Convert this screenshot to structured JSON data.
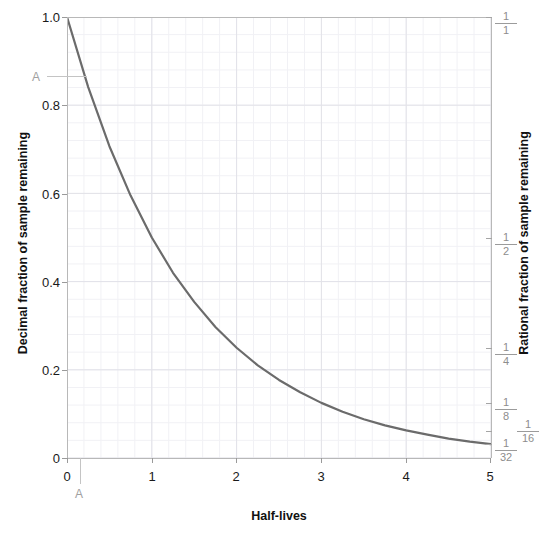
{
  "chart_data": {
    "type": "line",
    "title": "",
    "xlabel": "Half-lives",
    "ylabel": "Decimal fraction of sample remaining",
    "y2label": "Rational fraction of sample remaining",
    "xlim": [
      0,
      5
    ],
    "ylim": [
      0,
      1
    ],
    "grid": true,
    "minor_grid": true,
    "legend": "none",
    "series": [
      {
        "name": "remaining fraction",
        "color": "#6b6b6b",
        "x": [
          0,
          0.25,
          0.5,
          0.75,
          1,
          1.25,
          1.5,
          1.75,
          2,
          2.25,
          2.5,
          2.75,
          3,
          3.25,
          3.5,
          3.75,
          4,
          4.25,
          4.5,
          4.75,
          5
        ],
        "y": [
          1.0,
          0.841,
          0.707,
          0.595,
          0.5,
          0.42,
          0.354,
          0.297,
          0.25,
          0.21,
          0.177,
          0.149,
          0.125,
          0.105,
          0.088,
          0.074,
          0.0625,
          0.053,
          0.044,
          0.037,
          0.03125
        ]
      }
    ],
    "x_ticks": [
      {
        "value": 0,
        "label": "0"
      },
      {
        "value": 1,
        "label": "1"
      },
      {
        "value": 2,
        "label": "2"
      },
      {
        "value": 3,
        "label": "3"
      },
      {
        "value": 4,
        "label": "4"
      },
      {
        "value": 5,
        "label": "5"
      }
    ],
    "y_ticks": [
      {
        "value": 0,
        "label": "0"
      },
      {
        "value": 0.2,
        "label": "0.2"
      },
      {
        "value": 0.4,
        "label": "0.4"
      },
      {
        "value": 0.6,
        "label": "0.6"
      },
      {
        "value": 0.8,
        "label": "0.8"
      },
      {
        "value": 1.0,
        "label": "1.0"
      }
    ],
    "y2_ticks": [
      {
        "value": 1.0,
        "numerator": "1",
        "denominator": "1"
      },
      {
        "value": 0.5,
        "numerator": "1",
        "denominator": "2"
      },
      {
        "value": 0.25,
        "numerator": "1",
        "denominator": "4"
      },
      {
        "value": 0.125,
        "numerator": "1",
        "denominator": "8"
      },
      {
        "value": 0.0625,
        "numerator": "1",
        "denominator": "16"
      },
      {
        "value": 0.03125,
        "numerator": "1",
        "denominator": "32"
      }
    ],
    "annotations": [
      {
        "name": "y-marker-A",
        "label": "A",
        "axis": "y",
        "value": 0.9
      },
      {
        "name": "x-marker-A",
        "label": "A",
        "axis": "x",
        "value": 0.15
      }
    ]
  },
  "ticks": {
    "y": {
      "t0": "0",
      "t1": "0.2",
      "t2": "0.4",
      "t3": "0.6",
      "t4": "0.8",
      "t5": "1.0"
    },
    "x": {
      "t0": "0",
      "t1": "1",
      "t2": "2",
      "t3": "3",
      "t4": "4",
      "t5": "5"
    },
    "frac": {
      "f1": {
        "num": "1",
        "den": "1"
      },
      "f2": {
        "num": "1",
        "den": "2"
      },
      "f4": {
        "num": "1",
        "den": "4"
      },
      "f8": {
        "num": "1",
        "den": "8"
      },
      "f16": {
        "num": "1",
        "den": "16"
      },
      "f32": {
        "num": "1",
        "den": "32"
      }
    }
  },
  "labels": {
    "x_title": "Half-lives",
    "y_title": "Decimal fraction of sample remaining",
    "y2_title": "Rational fraction of sample remaining",
    "annot_y": "A",
    "annot_x": "A"
  },
  "colors": {
    "curve": "#6b6b6b",
    "axis": "#b8b8b8",
    "grid_major": "#e2e2e8",
    "grid_minor": "#f1f1f5",
    "text": "#1a1a1a",
    "muted_text": "#8d8d8d",
    "annotation": "#a0a0a0",
    "background": "#ffffff"
  }
}
